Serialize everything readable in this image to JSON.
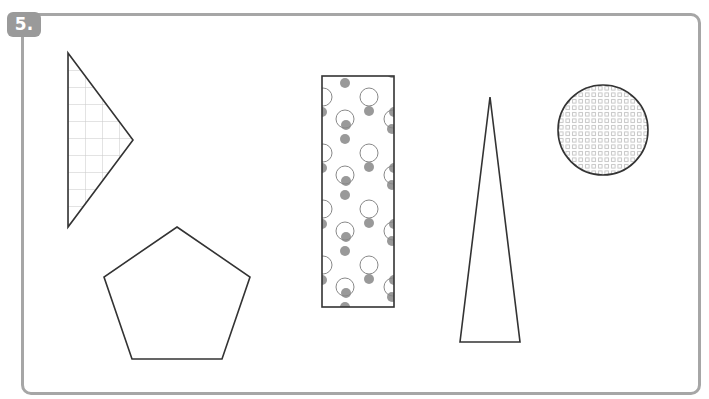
{
  "problem": {
    "number_label": "5."
  },
  "colors": {
    "frame": "#a6a6a6",
    "badge_bg": "#9a9a9a",
    "badge_text": "#ffffff",
    "outline": "#333333",
    "pattern_line": "#c8c8c8",
    "dot_fill": "#999999"
  },
  "shapes": [
    {
      "name": "triangle",
      "pattern": "grid",
      "points": [
        [
          68,
          53
        ],
        [
          133,
          140
        ],
        [
          68,
          227
        ]
      ]
    },
    {
      "name": "pentagon",
      "pattern": "none",
      "points": [
        [
          177,
          227
        ],
        [
          250,
          277
        ],
        [
          222,
          359
        ],
        [
          132,
          359
        ],
        [
          104,
          277
        ]
      ]
    },
    {
      "name": "rectangle",
      "pattern": "polka-dots",
      "x": 322,
      "y": 76,
      "width": 72,
      "height": 231
    },
    {
      "name": "tall-triangle",
      "pattern": "none",
      "points": [
        [
          490,
          97
        ],
        [
          520,
          342
        ],
        [
          460,
          342
        ]
      ]
    },
    {
      "name": "circle",
      "pattern": "small-squares",
      "cx": 603,
      "cy": 130,
      "r": 45
    }
  ]
}
